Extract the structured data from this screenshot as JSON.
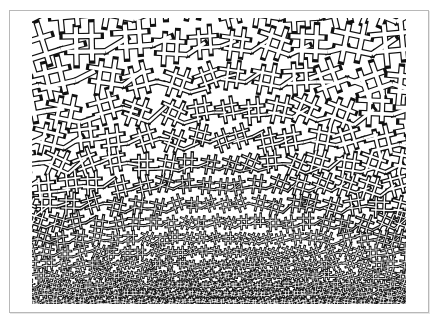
{
  "image": {
    "title": "Geometric interlace pattern",
    "description": "Islamic-style strapwork pattern with interlaced double-outlined bands, tiles diminishing in size toward the bottom center",
    "line_color": "#111111",
    "band_fill": "#ffffff",
    "frame_color": "#b8b8b8",
    "background": "#ffffff"
  }
}
